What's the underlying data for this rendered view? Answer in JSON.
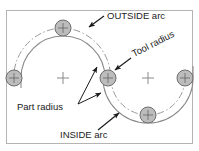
{
  "figure": {
    "background_color": "#ffffff",
    "border_color": "#b4b4b4",
    "part_line_color": "#7a7a7a",
    "tool_path_color": "#9a9a9a",
    "tool_circle_fill": "#b9b9b9",
    "tool_circle_stroke": "#6e6e6e",
    "center_mark_color": "#8a8a8a",
    "leader_color": "#1b1b1b",
    "text_color": "#1b1b1b"
  },
  "labels": {
    "outside_arc": "OUTSIDE arc",
    "tool_radius": "Tool radius",
    "part_radius": "Part radius",
    "inside_arc": "INSIDE arc"
  },
  "geometry": {
    "left_arc": {
      "center_x": 63,
      "center_y": 78,
      "part_radius": 42,
      "tool_radius": 8,
      "tool_center_radius": 50,
      "description": "OUTSIDE arc - tool center path lies outside the part radius"
    },
    "right_arc": {
      "center_x": 148,
      "center_y": 78,
      "part_radius": 45,
      "tool_radius": 8,
      "tool_center_radius": 37,
      "description": "INSIDE arc - tool center path lies inside the part radius"
    },
    "tool_circles": [
      {
        "name": "top-tool-circle",
        "cx": 63,
        "cy": 28,
        "r": 8
      },
      {
        "name": "left-tool-circle",
        "cx": 14,
        "cy": 78,
        "r": 8
      },
      {
        "name": "center-tool-circle",
        "cx": 108,
        "cy": 78,
        "r": 8
      },
      {
        "name": "bottom-tool-circle",
        "cx": 148,
        "cy": 115,
        "r": 8
      },
      {
        "name": "right-tool-circle",
        "cx": 185,
        "cy": 78,
        "r": 8
      }
    ],
    "center_marks": [
      {
        "name": "left-center-mark",
        "cx": 63,
        "cy": 78
      },
      {
        "name": "right-center-mark",
        "cx": 148,
        "cy": 78
      }
    ]
  }
}
